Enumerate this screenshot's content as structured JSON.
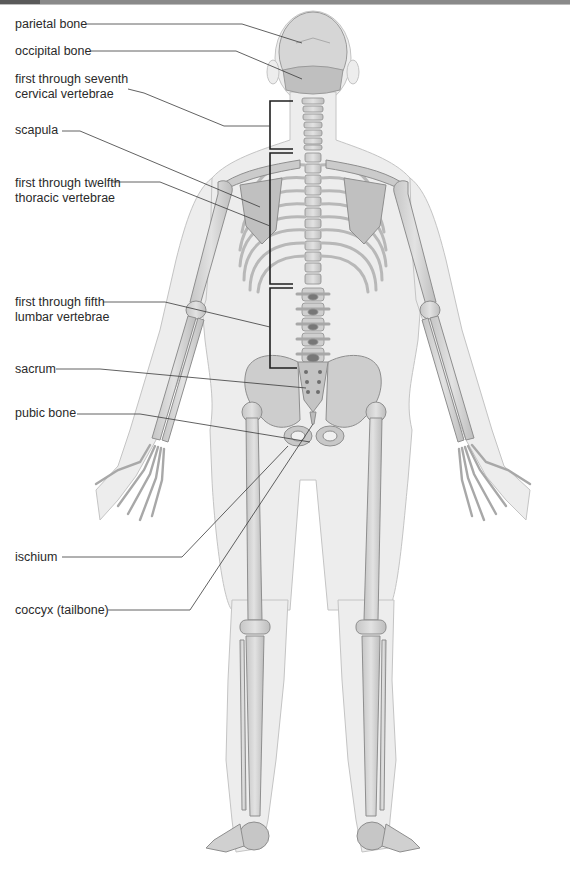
{
  "figure": {
    "colors": {
      "bone": "#d9d9d9",
      "bone_shade": "#b4b4b4",
      "bone_outline": "#8e8e8e",
      "body_silhouette": "#ececec",
      "body_outline": "#c2c2c2",
      "leader_line": "#3a3a3a",
      "bracket": "#1f1f1f",
      "label_text": "#2a2a2a",
      "header_bar": "#8a8a8a"
    }
  },
  "labels": [
    {
      "id": "parietal-bone",
      "lines": [
        "parietal bone"
      ],
      "x": 15,
      "y": 17
    },
    {
      "id": "occipital-bone",
      "lines": [
        "occipital bone"
      ],
      "x": 15,
      "y": 44
    },
    {
      "id": "cervical-vertebrae",
      "lines": [
        "first through seventh",
        "cervical vertebrae"
      ],
      "x": 15,
      "y": 72
    },
    {
      "id": "scapula",
      "lines": [
        "scapula"
      ],
      "x": 15,
      "y": 123
    },
    {
      "id": "thoracic-vertebrae",
      "lines": [
        "first through twelfth",
        "thoracic vertebrae"
      ],
      "x": 15,
      "y": 176
    },
    {
      "id": "lumbar-vertebrae",
      "lines": [
        "first through fifth",
        "lumbar vertebrae"
      ],
      "x": 15,
      "y": 295
    },
    {
      "id": "sacrum",
      "lines": [
        "sacrum"
      ],
      "x": 15,
      "y": 362
    },
    {
      "id": "pubic-bone",
      "lines": [
        "pubic bone"
      ],
      "x": 15,
      "y": 406
    },
    {
      "id": "ischium",
      "lines": [
        "ischium"
      ],
      "x": 15,
      "y": 550
    },
    {
      "id": "coccyx",
      "lines": [
        "coccyx (tailbone)"
      ],
      "x": 15,
      "y": 603
    }
  ]
}
